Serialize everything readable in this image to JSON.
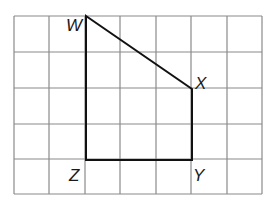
{
  "figure": {
    "type": "grid-shape",
    "grid": {
      "columns": 7,
      "rows": 5,
      "left": 14,
      "top": 16,
      "cell_w": 35.4,
      "cell_h": 35.6,
      "line_color": "#8a8a8a"
    },
    "shape_color": "#111111",
    "vertices": [
      {
        "label": "W",
        "col": 2,
        "row": 0
      },
      {
        "label": "X",
        "col": 5,
        "row": 2
      },
      {
        "label": "Y",
        "col": 5,
        "row": 4
      },
      {
        "label": "Z",
        "col": 2,
        "row": 4
      }
    ]
  },
  "labels": {
    "w": "W",
    "x": "X",
    "y": "Y",
    "z": "Z"
  }
}
